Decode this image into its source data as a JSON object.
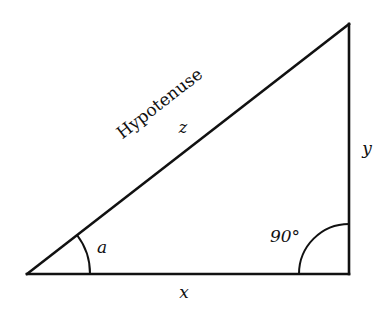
{
  "diagram": {
    "type": "right-triangle",
    "vertices": {
      "left": [
        27,
        274
      ],
      "right_angle": [
        349,
        274
      ],
      "top": [
        349,
        24
      ]
    },
    "labels": {
      "hypotenuse_name": "Hypotenuse",
      "hypotenuse_var": "z",
      "vertical_side": "y",
      "base_side": "x",
      "angle_a": "a",
      "right_angle": "90°"
    },
    "colors": {
      "stroke": "#111111",
      "background": "#ffffff"
    }
  }
}
